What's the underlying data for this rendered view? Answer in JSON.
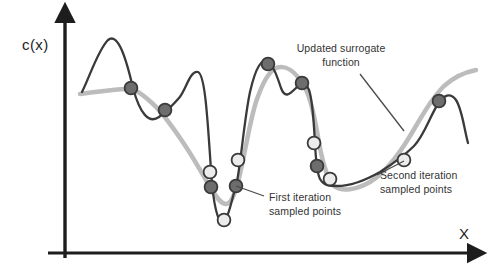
{
  "figure": {
    "background": "#ffffff",
    "width": 493,
    "height": 278
  },
  "axes": {
    "y_label": "c(x)",
    "x_label": "X",
    "axis_color": "#1d1d1d",
    "origin": {
      "x": 65,
      "y": 253
    },
    "y_top": {
      "x": 65,
      "y": 12
    },
    "x_right": {
      "x": 478,
      "y": 253
    }
  },
  "annotations": [
    {
      "id": "updated-surrogate",
      "line1": "Updated surrogate",
      "line2": "function",
      "text_x": 341,
      "text_y": 52,
      "leader": "M 360 74 L 404 131"
    },
    {
      "id": "first-iteration",
      "line1": "First iteration",
      "line2": "sampled points",
      "text_x": 269,
      "text_y": 201,
      "leader": "M 264 196 L 236 186"
    },
    {
      "id": "second-iteration",
      "line1": "Second iteration",
      "line2": "sampled points",
      "text_x": 380,
      "text_y": 179,
      "leader": "M 377 175 L 404 161"
    }
  ],
  "chart_data": {
    "type": "line",
    "title": "",
    "xlabel": "X",
    "ylabel": "c(x)",
    "grid": false,
    "legend": "none",
    "axis_ranges": {
      "x": [
        65,
        478
      ],
      "y": [
        12,
        253
      ]
    },
    "series": [
      {
        "name": "true function",
        "role": "objective",
        "color": "#3a3a3a",
        "stroke_width": 2.3,
        "path": "M 82 92 C 90 76, 98 50, 108 40 C 118 32, 126 58, 133 88 C 140 114, 149 124, 159 117 C 167 111, 172 106, 179 98 C 186 90, 190 70, 198 72 C 206 75, 208 130, 212 184 C 215 214, 220 226, 224 222 C 229 217, 232 198, 236 186 C 240 172, 244 120, 250 92 C 256 66, 262 58, 268 62 C 274 67, 277 76, 281 88 C 285 99, 290 94, 296 88 C 301 83, 305 80, 309 90 C 313 101, 314 126, 315 144 C 316 162, 317 173, 320 179 C 324 186, 330 186, 337 186 C 350 186, 366 180, 380 172 C 394 163, 404 156, 414 146 C 424 136, 430 116, 438 104 C 444 95, 450 92, 456 100 C 462 109, 464 128, 468 143"
      },
      {
        "name": "surrogate function",
        "role": "surrogate",
        "color": "#bcbcbc",
        "stroke_width": 4.5,
        "path": "M 80 94 C 95 92, 112 90, 124 89 C 135 88, 142 94, 152 103 C 162 112, 175 130, 188 150 C 197 164, 205 179, 212 190 C 217 198, 221 204, 226 204 C 231 204, 234 196, 238 182 C 244 160, 249 124, 256 102 C 262 84, 268 72, 276 68 C 286 64, 296 72, 304 86 C 312 100, 316 126, 320 148 C 324 168, 328 180, 334 186 C 342 192, 356 190, 370 182 C 386 172, 398 156, 410 136 C 422 116, 432 98, 444 86 C 455 76, 466 72, 476 70"
      }
    ],
    "sampled_points": [
      {
        "x": 131,
        "y": 88,
        "iteration": 1,
        "fill": "#6d6d6d"
      },
      {
        "x": 165,
        "y": 110,
        "iteration": 1,
        "fill": "#6d6d6d"
      },
      {
        "x": 210,
        "y": 172,
        "iteration": 2,
        "fill": "#ececec"
      },
      {
        "x": 211,
        "y": 187,
        "iteration": 1,
        "fill": "#6d6d6d"
      },
      {
        "x": 224,
        "y": 220,
        "iteration": 2,
        "fill": "#ececec"
      },
      {
        "x": 236,
        "y": 186,
        "iteration": 1,
        "fill": "#6d6d6d"
      },
      {
        "x": 238,
        "y": 160,
        "iteration": 2,
        "fill": "#ececec"
      },
      {
        "x": 268,
        "y": 64,
        "iteration": 1,
        "fill": "#6d6d6d"
      },
      {
        "x": 302,
        "y": 83,
        "iteration": 1,
        "fill": "#6d6d6d"
      },
      {
        "x": 314,
        "y": 143,
        "iteration": 2,
        "fill": "#ececec"
      },
      {
        "x": 317,
        "y": 166,
        "iteration": 1,
        "fill": "#6d6d6d"
      },
      {
        "x": 330,
        "y": 179,
        "iteration": 2,
        "fill": "#ececec"
      },
      {
        "x": 404,
        "y": 160,
        "iteration": 2,
        "fill": "#ececec"
      },
      {
        "x": 439,
        "y": 101,
        "iteration": 1,
        "fill": "#6d6d6d"
      }
    ],
    "marker_radius": 6.4,
    "marker_stroke": "#3a3a3a"
  }
}
